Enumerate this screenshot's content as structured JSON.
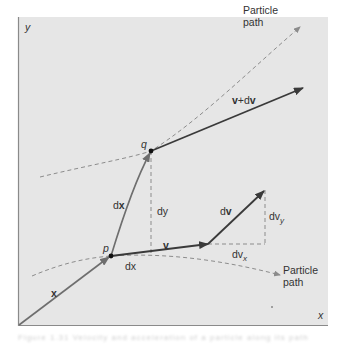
{
  "diagram": {
    "axes": {
      "x_label": "x",
      "y_label": "y"
    },
    "points": {
      "p": "p",
      "q": "q"
    },
    "vectors": {
      "position": "x",
      "displacement": {
        "d": "d",
        "bold": "x",
        "full": "dx"
      },
      "velocity": "v",
      "velocity_change": {
        "d": "d",
        "bold": "v",
        "full": "dv"
      },
      "new_velocity": {
        "v": "v",
        "plus": "+d",
        "dv": "v",
        "full": "v+dv"
      }
    },
    "components": {
      "dx": "dx",
      "dy": "dy",
      "dvx": {
        "base": "dv",
        "sub": "x"
      },
      "dvy": {
        "base": "dv",
        "sub": "y"
      }
    },
    "path_labels": {
      "upper": {
        "line1": "Particle",
        "line2": "path"
      },
      "lower": {
        "line1": "Particle",
        "line2": "path"
      }
    },
    "colors": {
      "background": "#e6e6e6",
      "frame": "#8a8a8a",
      "vector_dark": "#3a3a3a",
      "vector_gray": "#6e6e6e",
      "dashed": "#8c8c8c",
      "text": "#333333"
    }
  },
  "caption": "Figure 1.31 Velocity and acceleration of a particle along its path"
}
